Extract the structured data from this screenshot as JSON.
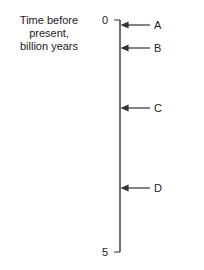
{
  "axis": {
    "title_lines": [
      "Time before",
      "present,",
      "billion years"
    ],
    "min_label": "0",
    "max_label": "5",
    "range": [
      0,
      5
    ],
    "unit": "billion years"
  },
  "markers": [
    {
      "label": "A",
      "value": 0.1
    },
    {
      "label": "B",
      "value": 0.6
    },
    {
      "label": "C",
      "value": 1.9
    },
    {
      "label": "D",
      "value": 3.6
    }
  ]
}
